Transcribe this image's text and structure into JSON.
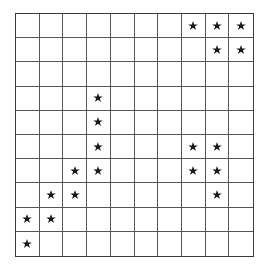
{
  "figure": {
    "name": "star-grid",
    "background_color": "#ffffff",
    "border_color": "#3a3a3a",
    "gridline_color": "#555555",
    "star_color": "#1a1a1a",
    "star_glyph": "five-pointed-star"
  },
  "chart_data": {
    "type": "heatmap",
    "title": "",
    "xlabel": "",
    "ylabel": "",
    "grid": true,
    "legend": "none",
    "rows": 10,
    "columns": 10,
    "marker": "star",
    "row_labels": [
      "1",
      "2",
      "3",
      "4",
      "5",
      "6",
      "7",
      "8",
      "9",
      "10"
    ],
    "column_labels": [
      "1",
      "2",
      "3",
      "4",
      "5",
      "6",
      "7",
      "8",
      "9",
      "10"
    ],
    "marked_cells": [
      {
        "row": 1,
        "col": 8
      },
      {
        "row": 1,
        "col": 9
      },
      {
        "row": 1,
        "col": 10
      },
      {
        "row": 2,
        "col": 9
      },
      {
        "row": 2,
        "col": 10
      },
      {
        "row": 4,
        "col": 4
      },
      {
        "row": 5,
        "col": 4
      },
      {
        "row": 6,
        "col": 4
      },
      {
        "row": 6,
        "col": 8
      },
      {
        "row": 6,
        "col": 9
      },
      {
        "row": 7,
        "col": 3
      },
      {
        "row": 7,
        "col": 4
      },
      {
        "row": 7,
        "col": 8
      },
      {
        "row": 7,
        "col": 9
      },
      {
        "row": 8,
        "col": 2
      },
      {
        "row": 8,
        "col": 3
      },
      {
        "row": 8,
        "col": 9
      },
      {
        "row": 9,
        "col": 1
      },
      {
        "row": 9,
        "col": 2
      },
      {
        "row": 10,
        "col": 1
      }
    ],
    "values": [
      [
        0,
        0,
        0,
        0,
        0,
        0,
        0,
        1,
        1,
        1
      ],
      [
        0,
        0,
        0,
        0,
        0,
        0,
        0,
        0,
        1,
        1
      ],
      [
        0,
        0,
        0,
        0,
        0,
        0,
        0,
        0,
        0,
        0
      ],
      [
        0,
        0,
        0,
        1,
        0,
        0,
        0,
        0,
        0,
        0
      ],
      [
        0,
        0,
        0,
        1,
        0,
        0,
        0,
        0,
        0,
        0
      ],
      [
        0,
        0,
        0,
        1,
        0,
        0,
        0,
        1,
        1,
        0
      ],
      [
        0,
        0,
        1,
        1,
        0,
        0,
        0,
        1,
        1,
        0
      ],
      [
        0,
        1,
        1,
        0,
        0,
        0,
        0,
        0,
        1,
        0
      ],
      [
        1,
        1,
        0,
        0,
        0,
        0,
        0,
        0,
        0,
        0
      ],
      [
        1,
        0,
        0,
        0,
        0,
        0,
        0,
        0,
        0,
        0
      ]
    ],
    "total_marks": 20
  }
}
